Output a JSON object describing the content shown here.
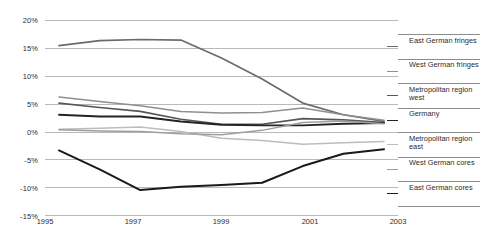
{
  "chart_data": {
    "type": "line",
    "title": "",
    "xlabel": "",
    "ylabel": "",
    "x": [
      1995,
      1996,
      1997,
      1998,
      1999,
      2000,
      2001,
      2002,
      2003
    ],
    "xtick_labels": [
      "1995",
      "1997",
      "1999",
      "2001",
      "2003"
    ],
    "xticks": [
      1995,
      1997,
      1999,
      2001,
      2003
    ],
    "ytick_labels": [
      "20%",
      "15%",
      "10%",
      "5%",
      "0%",
      "-5%",
      "-10%",
      "-15%"
    ],
    "yticks": [
      20,
      15,
      10,
      5,
      0,
      -5,
      -10,
      -15
    ],
    "ylim": [
      -15,
      20
    ],
    "xlim": [
      1995,
      2003
    ],
    "grid": true,
    "legend_position": "right",
    "series": [
      {
        "name": "East German fringes",
        "color": "#6b6b6b",
        "width": 1.7,
        "values": [
          15.4,
          16.3,
          16.5,
          16.4,
          13.2,
          9.4,
          5.1,
          3.0,
          1.8
        ]
      },
      {
        "name": "West German fringes",
        "color": "#8f8f8f",
        "width": 1.5,
        "values": [
          6.2,
          5.4,
          4.6,
          3.6,
          3.3,
          3.4,
          4.2,
          3.0,
          2.0
        ]
      },
      {
        "name": "Metropolitan region west",
        "color": "#575757",
        "width": 1.7,
        "values": [
          5.1,
          4.3,
          3.6,
          2.2,
          1.3,
          1.3,
          2.3,
          2.1,
          1.6
        ]
      },
      {
        "name": "Germany",
        "color": "#242424",
        "width": 1.9,
        "values": [
          3.0,
          2.7,
          2.7,
          1.8,
          1.2,
          1.1,
          1.1,
          1.4,
          1.5
        ]
      },
      {
        "name": "Metropolitan region east",
        "color": "#bdbdbd",
        "width": 1.5,
        "values": [
          0.4,
          0.6,
          0.8,
          0.0,
          -1.2,
          -1.6,
          -2.3,
          -2.0,
          -1.8
        ]
      },
      {
        "name": "West German cores",
        "color": "#9e9e9e",
        "width": 1.5,
        "values": [
          0.3,
          0.1,
          0.0,
          -0.4,
          -0.6,
          0.2,
          1.6,
          1.9,
          1.4
        ]
      },
      {
        "name": "East German cores",
        "color": "#1a1a1a",
        "width": 2.0,
        "values": [
          -3.4,
          -6.8,
          -10.5,
          -9.9,
          -9.6,
          -9.2,
          -6.2,
          -4.0,
          -3.2
        ]
      }
    ]
  },
  "legend": {
    "items": [
      {
        "label": "East German fringes",
        "series_index": 0
      },
      {
        "label": "West German fringes",
        "series_index": 1
      },
      {
        "label": "Metropolitan region west",
        "series_index": 2
      },
      {
        "label": "Germany",
        "series_index": 3
      },
      {
        "label": "Metropolitan region east",
        "series_index": 4
      },
      {
        "label": "West German cores",
        "series_index": 5
      },
      {
        "label": "East German cores",
        "series_index": 6
      }
    ]
  }
}
